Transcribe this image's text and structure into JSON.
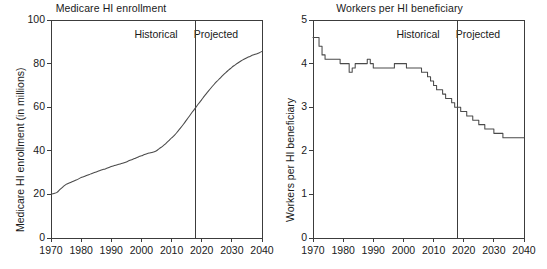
{
  "figure": {
    "background": "#ffffff",
    "line_color": "#4a4a4a",
    "axis_color": "#3c3c3c"
  },
  "chart_data": [
    {
      "id": "medicare-hi-enrollment",
      "type": "line",
      "title": "Medicare HI enrollment",
      "xlabel": "",
      "ylabel": "Medicare HI enrollment (in millions)",
      "xlim": [
        1970,
        2040
      ],
      "ylim": [
        0,
        100
      ],
      "xticks": [
        1970,
        1980,
        1990,
        2000,
        2010,
        2020,
        2030,
        2040
      ],
      "xticklabels": [
        "1970",
        "1980",
        "1990",
        "2000",
        "2010",
        "2020",
        "2030",
        "2040"
      ],
      "yticks": [
        0,
        20,
        40,
        60,
        80,
        100
      ],
      "yticklabels": [
        "0",
        "20",
        "40",
        "60",
        "80",
        "100"
      ],
      "grid": false,
      "legend": "none",
      "annotations": [
        {
          "text": "Historical",
          "x": 2010,
          "y": 93,
          "align": "right"
        },
        {
          "text": "Projected",
          "x": 2026,
          "y": 93,
          "align": "left"
        }
      ],
      "divider": {
        "x": 2018,
        "label": "historical-projected-divider"
      },
      "series": [
        {
          "name": "Medicare HI enrollment",
          "x": [
            1970,
            1971,
            1972,
            1973,
            1974,
            1975,
            1976,
            1977,
            1978,
            1979,
            1980,
            1981,
            1982,
            1983,
            1984,
            1985,
            1986,
            1987,
            1988,
            1989,
            1990,
            1991,
            1992,
            1993,
            1994,
            1995,
            1996,
            1997,
            1998,
            1999,
            2000,
            2001,
            2002,
            2003,
            2004,
            2005,
            2006,
            2007,
            2008,
            2009,
            2010,
            2011,
            2012,
            2013,
            2014,
            2015,
            2016,
            2017,
            2018,
            2019,
            2020,
            2021,
            2022,
            2023,
            2024,
            2025,
            2026,
            2027,
            2028,
            2029,
            2030,
            2031,
            2032,
            2033,
            2034,
            2035,
            2036,
            2037,
            2038,
            2039,
            2040
          ],
          "values": [
            20.1,
            20.4,
            20.9,
            22.3,
            23.5,
            24.6,
            25.2,
            25.8,
            26.4,
            27.0,
            27.8,
            28.2,
            28.8,
            29.3,
            29.8,
            30.3,
            30.8,
            31.3,
            31.7,
            32.2,
            32.8,
            33.2,
            33.6,
            34.0,
            34.4,
            34.9,
            35.5,
            36.0,
            36.6,
            37.2,
            37.7,
            38.3,
            38.8,
            39.1,
            39.5,
            40.0,
            41.1,
            42.0,
            43.2,
            44.5,
            45.9,
            47.2,
            48.8,
            50.5,
            52.3,
            54.2,
            56.1,
            58.0,
            59.8,
            61.7,
            63.5,
            65.3,
            67.0,
            68.7,
            70.3,
            71.8,
            73.2,
            74.6,
            75.9,
            77.1,
            78.3,
            79.3,
            80.3,
            81.2,
            82.0,
            82.7,
            83.3,
            83.9,
            84.4,
            84.9,
            85.6
          ]
        }
      ]
    },
    {
      "id": "workers-per-hi-beneficiary",
      "type": "line",
      "title": "Workers per HI beneficiary",
      "xlabel": "",
      "ylabel": "Workers per HI beneficiary",
      "xlim": [
        1970,
        2040
      ],
      "ylim": [
        0,
        5
      ],
      "xticks": [
        1970,
        1980,
        1990,
        2000,
        2010,
        2020,
        2030,
        2040
      ],
      "xticklabels": [
        "1970",
        "1980",
        "1990",
        "2000",
        "2010",
        "2020",
        "2030",
        "2040"
      ],
      "yticks": [
        0,
        1,
        2,
        3,
        4,
        5
      ],
      "yticklabels": [
        "0",
        "1",
        "2",
        "3",
        "4",
        "5"
      ],
      "grid": false,
      "legend": "none",
      "annotations": [
        {
          "text": "Historical",
          "x": 2010,
          "y": 4.65,
          "align": "right"
        },
        {
          "text": "Projected",
          "x": 2026,
          "y": 4.65,
          "align": "left"
        }
      ],
      "divider": {
        "x": 2018,
        "label": "historical-projected-divider"
      },
      "series": [
        {
          "name": "Workers per HI beneficiary",
          "x": [
            1970,
            1971,
            1972,
            1973,
            1974,
            1975,
            1976,
            1977,
            1978,
            1979,
            1980,
            1981,
            1982,
            1983,
            1984,
            1985,
            1986,
            1987,
            1988,
            1989,
            1990,
            1991,
            1992,
            1993,
            1994,
            1995,
            1996,
            1997,
            1998,
            1999,
            2000,
            2001,
            2002,
            2003,
            2004,
            2005,
            2006,
            2007,
            2008,
            2009,
            2010,
            2011,
            2012,
            2013,
            2014,
            2015,
            2016,
            2017,
            2018,
            2019,
            2020,
            2021,
            2022,
            2023,
            2024,
            2025,
            2026,
            2027,
            2028,
            2029,
            2030,
            2031,
            2032,
            2033,
            2034,
            2035,
            2036,
            2037,
            2038,
            2039,
            2040
          ],
          "values": [
            4.6,
            4.6,
            4.4,
            4.2,
            4.1,
            4.1,
            4.1,
            4.1,
            4.1,
            4.0,
            4.0,
            4.0,
            3.8,
            3.9,
            4.0,
            4.0,
            4.0,
            4.0,
            4.1,
            4.0,
            3.9,
            3.9,
            3.9,
            3.9,
            3.9,
            3.9,
            3.9,
            4.0,
            4.0,
            4.0,
            4.0,
            3.9,
            3.9,
            3.9,
            3.9,
            3.9,
            3.8,
            3.8,
            3.7,
            3.6,
            3.5,
            3.4,
            3.4,
            3.3,
            3.2,
            3.2,
            3.1,
            3.0,
            3.0,
            2.9,
            2.9,
            2.8,
            2.8,
            2.7,
            2.7,
            2.6,
            2.6,
            2.5,
            2.5,
            2.5,
            2.4,
            2.4,
            2.4,
            2.3,
            2.3,
            2.3,
            2.3,
            2.3,
            2.3,
            2.3,
            2.3
          ]
        }
      ]
    }
  ]
}
